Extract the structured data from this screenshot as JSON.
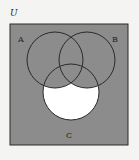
{
  "diagram": {
    "type": "venn",
    "universe_label": "U",
    "sets": [
      {
        "label": "A",
        "cx": 55,
        "cy": 60,
        "r": 28
      },
      {
        "label": "B",
        "cx": 87,
        "cy": 60,
        "r": 28
      },
      {
        "label": "C",
        "cx": 71,
        "cy": 92,
        "r": 28
      }
    ],
    "shaded_region": "U minus (C ∩ A' ∩ B')",
    "unshaded_region": "C only (C ∩ A' ∩ B')",
    "colors": {
      "background": "#f4f4f2",
      "shade": "#8c8c8c",
      "unshaded": "#ffffff",
      "stroke": "#2a2a2a"
    }
  }
}
